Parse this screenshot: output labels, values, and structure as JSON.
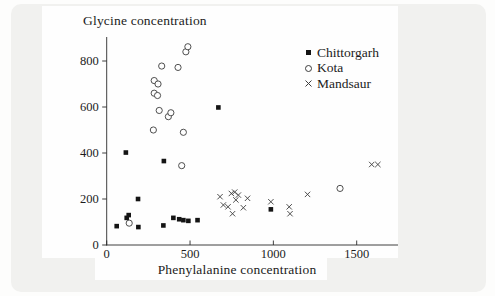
{
  "chart_data": {
    "type": "scatter",
    "title": "",
    "xlabel": "Phenylalanine concentration",
    "ylabel": "Glycine concentration",
    "xlim": [
      0,
      1750
    ],
    "ylim": [
      0,
      900
    ],
    "x_ticks": [
      0,
      500,
      1000,
      1500
    ],
    "y_ticks": [
      0,
      200,
      400,
      600,
      800
    ],
    "grid": false,
    "legend_position": "top-right",
    "axis_color": "#2b2b2b",
    "text_color": "#1c1c1c",
    "series": [
      {
        "name": "Chittorgarh",
        "marker": "filled-square",
        "color": "#141414",
        "points": [
          [
            60,
            82
          ],
          [
            115,
            402
          ],
          [
            120,
            118
          ],
          [
            132,
            130
          ],
          [
            188,
            200
          ],
          [
            190,
            78
          ],
          [
            340,
            85
          ],
          [
            343,
            365
          ],
          [
            400,
            118
          ],
          [
            435,
            112
          ],
          [
            460,
            108
          ],
          [
            490,
            105
          ],
          [
            545,
            108
          ],
          [
            670,
            598
          ],
          [
            985,
            155
          ]
        ]
      },
      {
        "name": "Kota",
        "marker": "open-circle",
        "color": "#3c3c3c",
        "points": [
          [
            135,
            95
          ],
          [
            280,
            500
          ],
          [
            285,
            660
          ],
          [
            285,
            715
          ],
          [
            305,
            650
          ],
          [
            308,
            700
          ],
          [
            315,
            585
          ],
          [
            330,
            778
          ],
          [
            370,
            558
          ],
          [
            385,
            575
          ],
          [
            428,
            772
          ],
          [
            450,
            345
          ],
          [
            460,
            490
          ],
          [
            475,
            840
          ],
          [
            487,
            862
          ],
          [
            1400,
            246
          ]
        ]
      },
      {
        "name": "Mandsaur",
        "marker": "x-cross",
        "color": "#3c3c3c",
        "points": [
          [
            680,
            210
          ],
          [
            700,
            174
          ],
          [
            728,
            166
          ],
          [
            748,
            224
          ],
          [
            755,
            136
          ],
          [
            768,
            230
          ],
          [
            775,
            196
          ],
          [
            790,
            217
          ],
          [
            820,
            162
          ],
          [
            845,
            203
          ],
          [
            985,
            188
          ],
          [
            1095,
            166
          ],
          [
            1100,
            136
          ],
          [
            1205,
            220
          ],
          [
            1590,
            350
          ],
          [
            1627,
            350
          ]
        ]
      }
    ]
  }
}
